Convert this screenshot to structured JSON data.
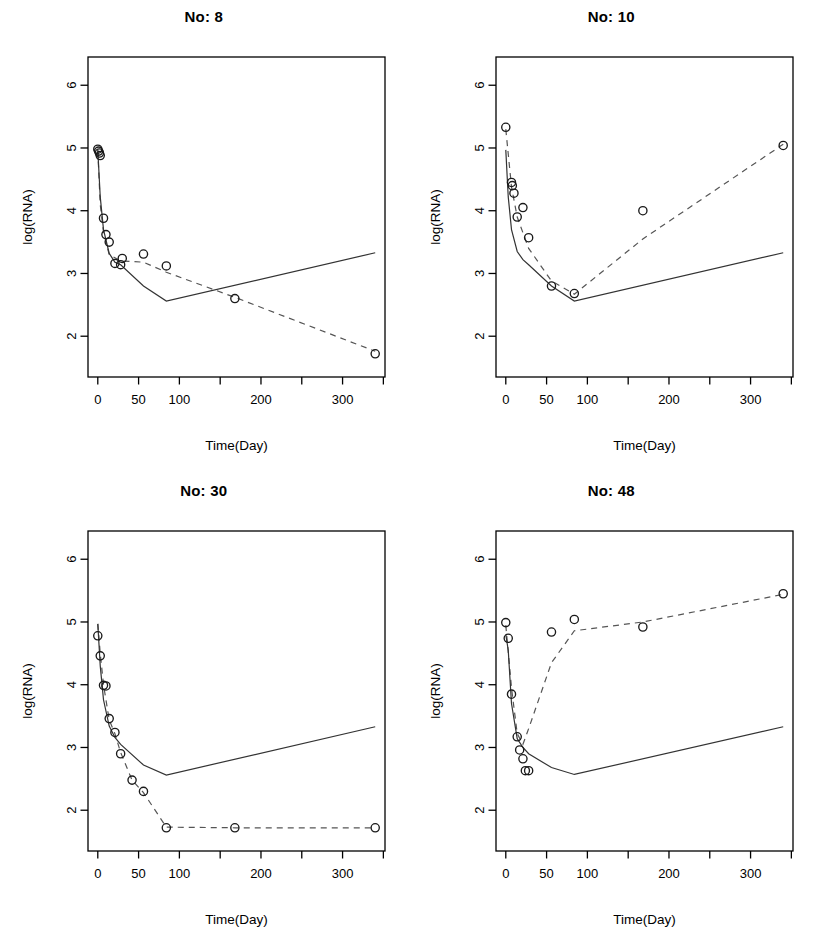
{
  "figure": {
    "panel_count": 4,
    "layout": "2x2",
    "background": "#ffffff",
    "foreground": "#000000",
    "observed_color": "#1a1a1a",
    "fitted_color": "#333333",
    "dashed_color": "#555555"
  },
  "axes": {
    "xlabel": "Time(Day)",
    "ylabel": "log(RNA)",
    "xlim": [
      -12,
      352
    ],
    "ylim": [
      1.35,
      6.45
    ],
    "xticks": [
      0,
      50,
      100,
      150,
      200,
      250,
      300,
      350
    ],
    "xtick_labels": [
      "0",
      "50",
      "100",
      "",
      "200",
      "",
      "300",
      ""
    ],
    "yticks": [
      2,
      3,
      4,
      5,
      6
    ],
    "ytick_labels": [
      "2",
      "3",
      "4",
      "5",
      "6"
    ],
    "grid": false
  },
  "chart_data": [
    {
      "type": "line",
      "title": "No: 8",
      "xlabel": "Time(Day)",
      "ylabel": "log(RNA)",
      "xlim": [
        -12,
        352
      ],
      "ylim": [
        1.35,
        6.45
      ],
      "grid": false,
      "legend": null,
      "series": [
        {
          "name": "observed",
          "style": "points",
          "marker": "open-circle",
          "x": [
            0,
            1,
            2,
            3,
            7,
            10,
            14,
            21,
            28,
            30,
            56,
            84,
            168,
            340
          ],
          "y": [
            4.98,
            4.95,
            4.92,
            4.88,
            3.88,
            3.62,
            3.5,
            3.16,
            3.14,
            3.24,
            3.31,
            3.12,
            2.6,
            1.72
          ]
        },
        {
          "name": "individual-fit",
          "style": "dashed",
          "x": [
            0,
            3,
            7,
            14,
            28,
            56,
            84,
            168,
            340
          ],
          "y": [
            4.96,
            4.1,
            3.66,
            3.3,
            3.2,
            3.18,
            3.02,
            2.62,
            1.76
          ]
        },
        {
          "name": "population-fit",
          "style": "solid",
          "x": [
            0,
            3,
            7,
            14,
            21,
            28,
            56,
            84,
            340
          ],
          "y": [
            4.97,
            4.22,
            3.7,
            3.32,
            3.18,
            3.14,
            2.8,
            2.56,
            3.33
          ]
        }
      ]
    },
    {
      "type": "line",
      "title": "No: 10",
      "xlabel": "Time(Day)",
      "ylabel": "log(RNA)",
      "xlim": [
        -12,
        352
      ],
      "ylim": [
        1.35,
        6.45
      ],
      "grid": false,
      "legend": null,
      "series": [
        {
          "name": "observed",
          "style": "points",
          "marker": "open-circle",
          "x": [
            0,
            7,
            8,
            10,
            14,
            21,
            28,
            56,
            84,
            168,
            340
          ],
          "y": [
            5.33,
            4.45,
            4.4,
            4.28,
            3.9,
            4.05,
            3.57,
            2.8,
            2.68,
            4.0,
            5.04
          ]
        },
        {
          "name": "individual-fit",
          "style": "dashed",
          "x": [
            0,
            7,
            14,
            28,
            56,
            84,
            168,
            340
          ],
          "y": [
            5.3,
            4.38,
            3.9,
            3.4,
            2.88,
            2.67,
            3.55,
            5.06
          ]
        },
        {
          "name": "population-fit",
          "style": "solid",
          "x": [
            0,
            3,
            7,
            14,
            21,
            28,
            56,
            84,
            340
          ],
          "y": [
            4.97,
            4.22,
            3.7,
            3.35,
            3.22,
            3.14,
            2.8,
            2.56,
            3.33
          ]
        }
      ]
    },
    {
      "type": "line",
      "title": "No: 30",
      "xlabel": "Time(Day)",
      "ylabel": "log(RNA)",
      "xlim": [
        -12,
        352
      ],
      "ylim": [
        1.35,
        6.45
      ],
      "grid": false,
      "legend": null,
      "series": [
        {
          "name": "observed",
          "style": "points",
          "marker": "open-circle",
          "x": [
            0,
            3,
            7,
            10,
            14,
            21,
            28,
            42,
            56,
            84,
            168,
            340
          ],
          "y": [
            4.78,
            4.46,
            3.99,
            3.98,
            3.46,
            3.24,
            2.9,
            2.48,
            2.3,
            1.72,
            1.72,
            1.72
          ]
        },
        {
          "name": "individual-fit",
          "style": "dashed",
          "x": [
            0,
            3,
            7,
            14,
            21,
            28,
            42,
            56,
            84,
            168,
            340
          ],
          "y": [
            4.97,
            4.5,
            4.0,
            3.44,
            3.22,
            2.92,
            2.48,
            2.28,
            1.73,
            1.72,
            1.72
          ]
        },
        {
          "name": "population-fit",
          "style": "solid",
          "x": [
            0,
            3,
            7,
            14,
            21,
            28,
            56,
            84,
            340
          ],
          "y": [
            4.97,
            4.3,
            3.76,
            3.34,
            3.16,
            3.05,
            2.72,
            2.56,
            3.33
          ]
        }
      ]
    },
    {
      "type": "line",
      "title": "No: 48",
      "xlabel": "Time(Day)",
      "ylabel": "log(RNA)",
      "xlim": [
        -12,
        352
      ],
      "ylim": [
        1.35,
        6.45
      ],
      "grid": false,
      "legend": null,
      "series": [
        {
          "name": "observed",
          "style": "points",
          "marker": "open-circle",
          "x": [
            0,
            3,
            7,
            14,
            17,
            21,
            24,
            28,
            56,
            84,
            168,
            340
          ],
          "y": [
            4.99,
            4.74,
            3.85,
            3.17,
            2.96,
            2.82,
            2.63,
            2.63,
            4.84,
            5.04,
            4.92,
            5.45
          ]
        },
        {
          "name": "individual-fit",
          "style": "dashed",
          "x": [
            0,
            7,
            14,
            21,
            28,
            56,
            84,
            168,
            340
          ],
          "y": [
            4.95,
            3.95,
            3.22,
            3.05,
            3.3,
            4.35,
            4.86,
            5.0,
            5.44
          ]
        },
        {
          "name": "population-fit",
          "style": "solid",
          "x": [
            0,
            3,
            7,
            14,
            21,
            28,
            56,
            84,
            340
          ],
          "y": [
            4.8,
            4.55,
            3.7,
            3.14,
            3.0,
            2.9,
            2.68,
            2.57,
            3.33
          ]
        }
      ]
    }
  ]
}
